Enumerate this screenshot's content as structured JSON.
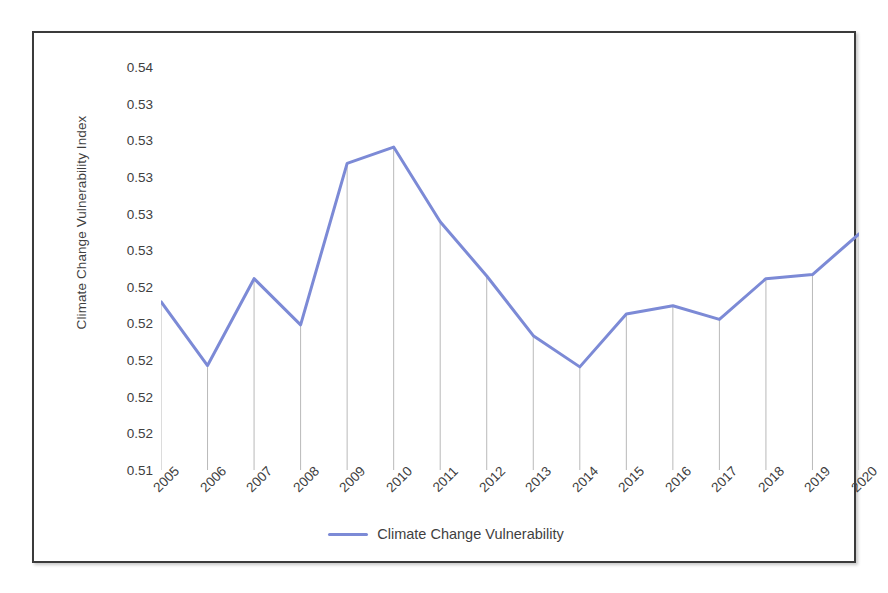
{
  "chart_data": {
    "type": "line",
    "title": "",
    "xlabel": "",
    "ylabel": "Climate Change Vulnerability Index",
    "categories": [
      "2005",
      "2006",
      "2007",
      "2008",
      "2009",
      "2010",
      "2011",
      "2012",
      "2013",
      "2014",
      "2015",
      "2016",
      "2017",
      "2018",
      "2019",
      "2020"
    ],
    "series": [
      {
        "name": "Climate Change Vulnerability",
        "color": "#7C8AD6",
        "values": [
          0.5227,
          0.518,
          0.5244,
          0.521,
          0.5329,
          0.5341,
          0.5286,
          0.5246,
          0.5202,
          0.5179,
          0.5218,
          0.5224,
          0.5214,
          0.5244,
          0.5247,
          0.5277
        ]
      }
    ],
    "ytick_labels": [
      "0.54",
      "0.53",
      "0.53",
      "0.53",
      "0.53",
      "0.53",
      "0.52",
      "0.52",
      "0.52",
      "0.52",
      "0.52",
      "0.51"
    ],
    "ytick_values": [
      0.54,
      0.5373,
      0.5346,
      0.5319,
      0.5292,
      0.5265,
      0.5238,
      0.5211,
      0.5184,
      0.5157,
      0.513,
      0.5103
    ],
    "ylim": [
      0.5103,
      0.54
    ],
    "grid": false,
    "droplines": true,
    "dropline_color": "#b9b9b9",
    "legend_position": "bottom-center",
    "legend_entries": [
      "Climate Change Vulnerability"
    ],
    "marker": "none",
    "line_width": 3
  },
  "legend": {
    "label": "Climate Change Vulnerability"
  },
  "axis": {
    "y_title": "Climate Change Vulnerability Index"
  },
  "style": {
    "frame_color": "#3b3b3b",
    "background": "#ffffff",
    "tick_text_color": "#404040"
  }
}
